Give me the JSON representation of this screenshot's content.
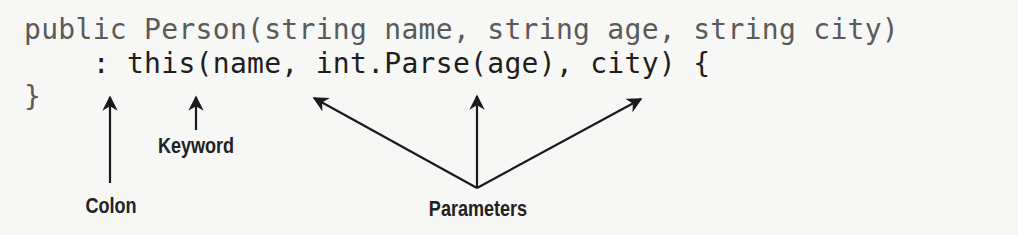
{
  "code": {
    "line1": "public Person(string name, string age, string city)",
    "line2": "    : this(name, int.Parse(age), city) {",
    "line3": "}"
  },
  "annotations": {
    "colon": "Colon",
    "keyword": "Keyword",
    "parameters": "Parameters"
  },
  "colors": {
    "signature_text": "#5a5a5a",
    "initializer_text": "#1e1e1e",
    "arrow": "#1a1a1a",
    "background": "#f7f7f5"
  }
}
